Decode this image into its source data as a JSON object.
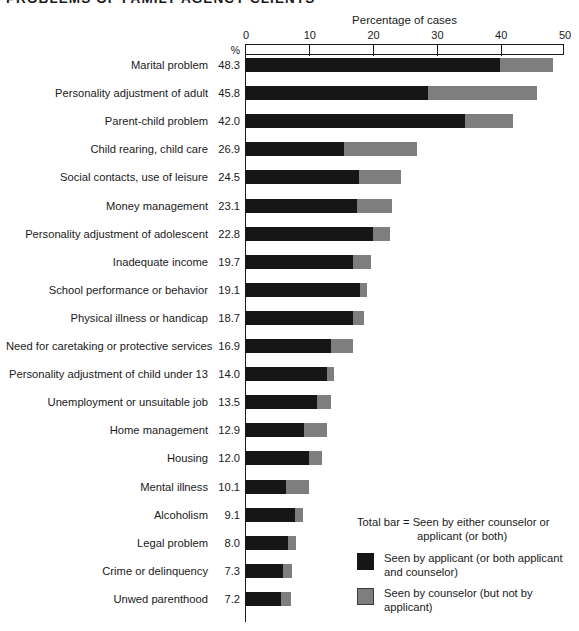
{
  "title": "PROBLEMS OF FAMILY AGENCY CLIENTS",
  "axis_title": "Percentage of cases",
  "percent_header": "%",
  "colors": {
    "applicant": "#161616",
    "counselor": "#7e7e7e",
    "axis": "#1a1a1a",
    "background": "#ffffff"
  },
  "legend": {
    "total_line1": "Total bar = Seen by either counselor or",
    "total_line2": "applicant (or both)",
    "applicant_line1": "Seen by applicant (or both applicant",
    "applicant_line2": "and counselor)",
    "counselor_line1": "Seen by counselor (but not by applicant)"
  },
  "chart_data": {
    "type": "bar",
    "orientation": "horizontal",
    "stacked": true,
    "title": "PROBLEMS OF FAMILY AGENCY CLIENTS",
    "xlabel": "Percentage of cases",
    "ylabel": "",
    "xlim": [
      0,
      50
    ],
    "xticks": [
      0,
      10,
      20,
      30,
      40,
      50
    ],
    "xtick_labels": [
      "0",
      "10",
      "20",
      "30",
      "40",
      "50"
    ],
    "grid": false,
    "legend_position": "bottom-right",
    "value_column_header": "%",
    "categories": [
      "Marital problem",
      "Personality adjustment of adult",
      "Parent-child problem",
      "Child rearing, child care",
      "Social contacts, use of leisure",
      "Money management",
      "Personality adjustment of adolescent",
      "Inadequate income",
      "School performance or behavior",
      "Physical illness or handicap",
      "Need for caretaking or protective services",
      "Personality adjustment of child under 13",
      "Unemployment or unsuitable job",
      "Home management",
      "Housing",
      "Mental illness",
      "Alcoholism",
      "Legal problem",
      "Crime or delinquency",
      "Unwed parenthood"
    ],
    "totals": [
      48.3,
      45.8,
      42.0,
      26.9,
      24.5,
      23.1,
      22.8,
      19.7,
      19.1,
      18.7,
      16.9,
      14.0,
      13.5,
      12.9,
      12.0,
      10.1,
      9.1,
      8.0,
      7.3,
      7.2
    ],
    "total_labels": [
      "48.3",
      "45.8",
      "42.0",
      "26.9",
      "24.5",
      "23.1",
      "22.8",
      "19.7",
      "19.1",
      "18.7",
      "16.9",
      "14.0",
      "13.5",
      "12.9",
      "12.0",
      "10.1",
      "9.1",
      "8.0",
      "7.3",
      "7.2"
    ],
    "series": [
      {
        "name": "Seen by applicant (or both applicant and counselor)",
        "color": "#161616",
        "values": [
          40.0,
          28.7,
          34.5,
          15.5,
          17.8,
          17.5,
          20.0,
          17.0,
          18.0,
          17.0,
          13.5,
          12.8,
          11.3,
          9.2,
          10.0,
          6.5,
          7.9,
          6.7,
          5.9,
          5.6
        ]
      },
      {
        "name": "Seen by counselor (but not by applicant)",
        "color": "#7e7e7e",
        "values": [
          8.3,
          17.1,
          7.5,
          11.4,
          6.7,
          5.6,
          2.8,
          2.7,
          1.1,
          1.7,
          3.4,
          1.2,
          2.2,
          3.7,
          2.0,
          3.6,
          1.2,
          1.3,
          1.4,
          1.6
        ]
      }
    ]
  }
}
